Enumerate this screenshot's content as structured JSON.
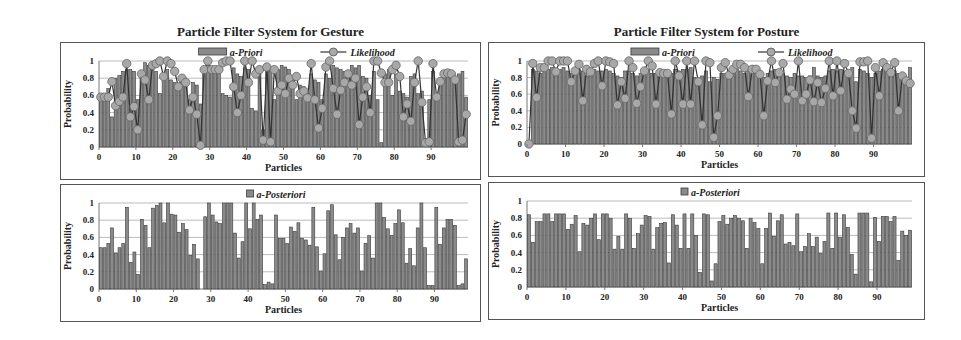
{
  "titles": {
    "gesture": "Particle Filter System for Gesture",
    "posture": "Particle Filter System for Posture"
  },
  "colors": {
    "bar_fill": "#8a8a8a",
    "bar_stroke": "#3a3a3a",
    "marker_fill": "#a8a8a8",
    "marker_stroke": "#666666",
    "line": "#333333",
    "grid": "#bbbbbb"
  },
  "chart_data": [
    {
      "id": "gesture_prior",
      "type": "bar+line",
      "title": "Particle Filter System for Gesture",
      "xlabel": "Particles",
      "ylabel": "Probability",
      "ylim": [
        0,
        1
      ],
      "yticks": [
        "0",
        "0.2",
        "0.4",
        "0.6",
        "0.8",
        "1"
      ],
      "xticks": [
        "0",
        "10",
        "20",
        "30",
        "40",
        "50",
        "60",
        "70",
        "80",
        "90"
      ],
      "grid": true,
      "legend": [
        "a-Priori",
        "Likelihood"
      ],
      "series": [
        {
          "name": "a-Priori",
          "type": "bar",
          "values": [
            0.55,
            0.58,
            0.68,
            0.35,
            0.8,
            0.83,
            0.88,
            0.9,
            0.9,
            0.88,
            0.55,
            0.85,
            0.98,
            0.95,
            0.9,
            0.88,
            0.62,
            0.85,
            0.9,
            0.78,
            0.75,
            0.7,
            0.75,
            0.78,
            0.55,
            0.75,
            0.72,
            0.5,
            0.92,
            0.95,
            0.92,
            0.9,
            0.92,
            0.62,
            0.6,
            0.58,
            0.92,
            0.85,
            0.82,
            0.92,
            0.9,
            0.45,
            0.42,
            0.85,
            0.2,
            0.95,
            0.9,
            0.55,
            0.9,
            0.95,
            0.93,
            0.9,
            0.82,
            0.55,
            0.72,
            0.7,
            0.62,
            0.85,
            0.78,
            0.75,
            0.55,
            0.85,
            0.8,
            0.95,
            0.92,
            0.9,
            0.88,
            0.82,
            0.95,
            0.92,
            0.95,
            0.82,
            0.8,
            0.6,
            0.88,
            0.55,
            0.05,
            0.85,
            0.9,
            0.6,
            0.85,
            0.65,
            0.62,
            0.58,
            0.82,
            0.85,
            0.62,
            0.65,
            0.1,
            0.55,
            0.88,
            0.55,
            0.8,
            0.88,
            0.88,
            0.85,
            0.78,
            0.85,
            0.88,
            0.58
          ]
        },
        {
          "name": "Likelihood",
          "type": "line",
          "values": [
            0.58,
            0.58,
            0.58,
            0.76,
            0.48,
            0.53,
            0.58,
            0.97,
            0.35,
            0.47,
            0.2,
            0.85,
            0.78,
            0.55,
            0.95,
            0.97,
            1.0,
            0.82,
            1.0,
            0.97,
            0.88,
            0.7,
            0.8,
            0.75,
            0.43,
            0.58,
            0.38,
            0.02,
            0.9,
            1.0,
            0.9,
            0.9,
            0.9,
            0.98,
            1.0,
            1.0,
            0.7,
            0.4,
            0.6,
            1.0,
            0.75,
            1.0,
            0.85,
            0.9,
            0.08,
            0.93,
            0.06,
            0.9,
            0.65,
            0.72,
            0.62,
            0.8,
            0.72,
            0.82,
            0.62,
            0.65,
            0.57,
            0.97,
            0.55,
            0.22,
            0.45,
            0.93,
            1.0,
            0.68,
            0.38,
            0.66,
            0.75,
            0.85,
            0.72,
            0.8,
            0.26,
            0.58,
            0.7,
            0.4,
            1.0,
            1.0,
            0.86,
            0.75,
            0.75,
            0.9,
            0.95,
            0.82,
            0.35,
            0.5,
            0.3,
            0.75,
            1.0,
            0.52,
            0.05,
            0.06,
            0.97,
            0.58,
            0.76,
            0.85,
            0.86,
            0.85,
            0.78,
            0.06,
            0.08,
            0.38
          ]
        }
      ]
    },
    {
      "id": "gesture_posterior",
      "type": "bar",
      "xlabel": "Particles",
      "ylabel": "Probability",
      "ylim": [
        0,
        1
      ],
      "yticks": [
        "0",
        "0.2",
        "0.4",
        "0.6",
        "0.8",
        "1"
      ],
      "xticks": [
        "0",
        "10",
        "20",
        "30",
        "40",
        "50",
        "60",
        "70",
        "80",
        "90"
      ],
      "grid": true,
      "legend": [
        "a-Posteriori"
      ],
      "series": [
        {
          "name": "a-Posteriori",
          "values": [
            0.48,
            0.48,
            0.53,
            0.71,
            0.42,
            0.48,
            0.53,
            0.95,
            0.31,
            0.43,
            0.17,
            0.81,
            0.74,
            0.48,
            0.94,
            0.97,
            1.0,
            0.77,
            1.0,
            0.87,
            0.86,
            0.66,
            0.76,
            0.69,
            0.39,
            0.52,
            0.35,
            0.0,
            0.84,
            1.0,
            0.86,
            0.78,
            0.76,
            1.0,
            1.0,
            1.0,
            0.65,
            0.36,
            0.55,
            1.0,
            0.7,
            1.0,
            0.81,
            0.86,
            0.05,
            0.08,
            0.06,
            0.86,
            0.59,
            0.59,
            0.53,
            0.72,
            0.67,
            0.77,
            0.59,
            0.57,
            0.51,
            0.95,
            0.49,
            0.21,
            0.41,
            0.91,
            0.98,
            0.63,
            0.34,
            0.6,
            0.71,
            0.76,
            0.65,
            0.71,
            0.21,
            0.53,
            0.62,
            0.36,
            1.0,
            1.0,
            0.83,
            0.7,
            0.62,
            0.76,
            0.92,
            0.77,
            0.3,
            0.47,
            0.27,
            0.71,
            1.0,
            0.48,
            0.04,
            0.04,
            0.95,
            0.52,
            0.71,
            0.81,
            0.81,
            0.74,
            0.04,
            0.06,
            0.35
          ]
        }
      ]
    },
    {
      "id": "posture_prior",
      "type": "bar+line",
      "title": "Particle Filter System for Posture",
      "xlabel": "Particles",
      "ylabel": "Probability",
      "ylim": [
        0,
        1
      ],
      "yticks": [
        "0",
        "0.2",
        "0.4",
        "0.6",
        "0.8",
        "1"
      ],
      "xticks": [
        "0",
        "10",
        "20",
        "30",
        "40",
        "50",
        "60",
        "70",
        "80",
        "90"
      ],
      "grid": true,
      "legend": [
        "a-Priori",
        "Likelihood"
      ],
      "series": [
        {
          "name": "a-Priori",
          "type": "bar",
          "values": [
            0.0,
            0.9,
            0.88,
            0.85,
            0.88,
            0.9,
            0.92,
            0.9,
            0.9,
            0.92,
            0.88,
            0.85,
            0.88,
            0.9,
            0.88,
            0.82,
            0.88,
            0.9,
            0.88,
            0.88,
            0.9,
            0.88,
            0.85,
            0.82,
            0.8,
            0.88,
            0.88,
            0.85,
            0.82,
            0.85,
            0.88,
            0.9,
            0.85,
            0.85,
            0.85,
            0.82,
            0.82,
            0.85,
            0.9,
            0.88,
            0.9,
            0.9,
            0.92,
            0.8,
            0.78,
            0.82,
            0.88,
            0.75,
            0.8,
            0.78,
            0.85,
            0.85,
            0.88,
            0.88,
            0.9,
            0.88,
            0.85,
            0.88,
            0.88,
            0.85,
            0.82,
            0.8,
            0.85,
            0.88,
            0.9,
            0.88,
            0.85,
            0.82,
            0.8,
            0.85,
            0.82,
            0.82,
            0.8,
            0.82,
            0.92,
            0.82,
            0.8,
            0.82,
            0.88,
            0.9,
            0.88,
            0.9,
            0.88,
            0.85,
            0.92,
            0.75,
            0.9,
            0.88,
            0.85,
            0.8,
            0.85,
            0.88,
            0.9,
            0.9,
            0.88,
            0.88,
            0.85,
            0.82,
            0.8,
            0.92
          ]
        },
        {
          "name": "Likelihood",
          "type": "line",
          "values": [
            0.0,
            0.97,
            0.56,
            0.92,
            0.92,
            1.0,
            1.0,
            0.87,
            1.0,
            1.0,
            1.0,
            0.75,
            0.88,
            0.96,
            0.52,
            0.9,
            0.87,
            0.97,
            1.0,
            0.7,
            1.0,
            0.99,
            0.97,
            0.47,
            0.75,
            0.55,
            1.0,
            0.92,
            0.49,
            0.69,
            0.88,
            1.0,
            0.94,
            0.48,
            0.86,
            0.85,
            0.85,
            0.36,
            1.0,
            0.82,
            0.48,
            1.0,
            0.48,
            1.0,
            0.75,
            0.23,
            1.0,
            0.98,
            0.08,
            0.34,
            0.92,
            0.98,
            0.83,
            0.9,
            0.96,
            0.96,
            0.92,
            0.57,
            0.9,
            0.9,
            0.84,
            0.34,
            0.76,
            1.0,
            0.74,
            0.86,
            0.97,
            0.54,
            0.66,
            0.6,
            1.0,
            0.52,
            0.6,
            0.77,
            0.51,
            0.74,
            0.5,
            0.67,
            1.0,
            0.58,
            1.0,
            0.64,
            0.97,
            0.85,
            0.4,
            0.19,
            0.99,
            0.99,
            1.0,
            0.07,
            0.92,
            0.58,
            0.98,
            0.92,
            0.86,
            0.98,
            0.4,
            0.82,
            0.76,
            0.73
          ]
        }
      ]
    },
    {
      "id": "posture_posterior",
      "type": "bar",
      "xlabel": "Particles",
      "ylabel": "Probability",
      "ylim": [
        0,
        1
      ],
      "yticks": [
        "0",
        "0.2",
        "0.4",
        "0.6",
        "0.8",
        "1"
      ],
      "xticks": [
        "0",
        "10",
        "20",
        "30",
        "40",
        "50",
        "60",
        "70",
        "80",
        "90"
      ],
      "grid": true,
      "legend": [
        "a-Posteriori"
      ],
      "series": [
        {
          "name": "a-Posteriori",
          "values": [
            0.84,
            0.52,
            0.76,
            0.76,
            0.85,
            0.85,
            0.76,
            0.85,
            0.85,
            0.85,
            0.67,
            0.73,
            0.83,
            0.41,
            0.74,
            0.72,
            0.8,
            0.85,
            0.55,
            0.85,
            0.85,
            0.8,
            0.44,
            0.59,
            0.44,
            0.85,
            0.8,
            0.45,
            0.62,
            0.72,
            0.83,
            0.82,
            0.44,
            0.69,
            0.74,
            0.75,
            0.28,
            0.84,
            0.72,
            0.45,
            0.85,
            0.45,
            0.85,
            0.6,
            0.17,
            0.85,
            0.84,
            0.07,
            0.27,
            0.76,
            0.83,
            0.73,
            0.8,
            0.83,
            0.8,
            0.77,
            0.45,
            0.8,
            0.75,
            0.68,
            0.27,
            0.68,
            0.86,
            0.59,
            0.77,
            0.84,
            0.5,
            0.52,
            0.48,
            0.85,
            0.41,
            0.47,
            0.62,
            0.47,
            0.58,
            0.39,
            0.53,
            0.86,
            0.45,
            0.86,
            0.58,
            0.84,
            0.69,
            0.38,
            0.15,
            0.86,
            0.86,
            0.86,
            0.06,
            0.81,
            0.53,
            0.82,
            0.82,
            0.76,
            0.82,
            0.31,
            0.65,
            0.6,
            0.66
          ]
        }
      ]
    }
  ]
}
